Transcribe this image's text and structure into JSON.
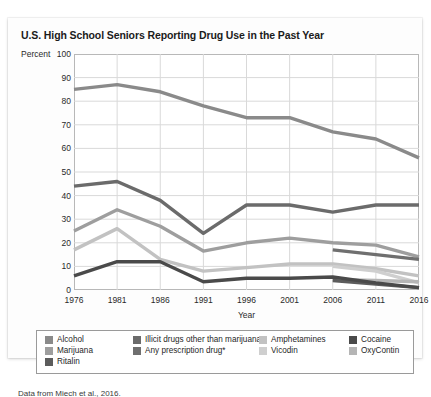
{
  "figure": {
    "title": "U.S. High School Seniors Reporting Drug Use in the Past Year",
    "percent_axis_label": "Percent",
    "source_note": "Data from Miech et al., 2016."
  },
  "chart_data": {
    "type": "line",
    "title": "U.S. High School Seniors Reporting Drug Use in the Past Year",
    "xlabel": "Year",
    "ylabel": "Percent",
    "x": [
      1976,
      1981,
      1986,
      1991,
      1996,
      2001,
      2006,
      2011,
      2016
    ],
    "xlim": [
      1976,
      2016
    ],
    "ylim": [
      0,
      100
    ],
    "xticks": [
      "1976",
      "1981",
      "1986",
      "1991",
      "1996",
      "2001",
      "2006",
      "2011",
      "2016"
    ],
    "yticks": [
      "0",
      "10",
      "20",
      "30",
      "40",
      "50",
      "60",
      "70",
      "80",
      "90",
      "100"
    ],
    "grid": true,
    "legend_position": "below",
    "series": [
      {
        "name": "Alcohol",
        "color": "#8a8a8a",
        "x": [
          1976,
          1981,
          1986,
          1991,
          1996,
          2001,
          2006,
          2011,
          2016
        ],
        "values": [
          85,
          87,
          84,
          78,
          73,
          73,
          67,
          64,
          56
        ]
      },
      {
        "name": "Illicit drugs other than marijuana",
        "color": "#6b6b6b",
        "x": [
          1976,
          1981,
          1986,
          1991,
          1996,
          2001,
          2006,
          2011,
          2016
        ],
        "values": [
          44,
          46,
          38,
          24,
          36,
          36,
          33,
          36,
          36
        ]
      },
      {
        "name": "Marijuana",
        "color": "#9e9e9e",
        "x": [
          1976,
          1981,
          1986,
          1991,
          1996,
          2001,
          2006,
          2011,
          2016
        ],
        "values": [
          25,
          34,
          27,
          16.5,
          20,
          22,
          20,
          19,
          14
        ]
      },
      {
        "name": "Any prescription drug*",
        "color": "#6f6f6f",
        "x": [
          2006,
          2011,
          2016
        ],
        "values": [
          17,
          15,
          13
        ]
      },
      {
        "name": "Amphetamines",
        "color": "#c2c2c2",
        "x": [
          1976,
          1981,
          1986,
          1991,
          1996,
          2001,
          2006,
          2011,
          2016
        ],
        "values": [
          17,
          26,
          13,
          8,
          9.5,
          11,
          11,
          9,
          6
        ]
      },
      {
        "name": "Vicodin",
        "color": "#cfcfcf",
        "x": [
          2006,
          2011,
          2016
        ],
        "values": [
          10,
          8,
          3
        ]
      },
      {
        "name": "Cocaine",
        "color": "#4a4a4a",
        "x": [
          1976,
          1981,
          1986,
          1991,
          1996,
          2001,
          2006,
          2011,
          2016
        ],
        "values": [
          6,
          12,
          12,
          3.5,
          5,
          5,
          5.5,
          3,
          1
        ]
      },
      {
        "name": "OxyContin",
        "color": "#b5b5b5",
        "x": [
          2006,
          2011,
          2016
        ],
        "values": [
          4.5,
          4,
          3.5
        ]
      },
      {
        "name": "Ritalin",
        "color": "#5c5c5c",
        "x": [
          2006,
          2011,
          2016
        ],
        "values": [
          4,
          2.5,
          1
        ]
      }
    ]
  },
  "legend": {
    "items": [
      {
        "label": "Alcohol",
        "color": "#8a8a8a",
        "col": 0,
        "row": 0
      },
      {
        "label": "Marijuana",
        "color": "#9e9e9e",
        "col": 0,
        "row": 1
      },
      {
        "label": "Ritalin",
        "color": "#5c5c5c",
        "col": 0,
        "row": 2
      },
      {
        "label": "Illicit drugs other than marijuana",
        "color": "#6b6b6b",
        "col": 1,
        "row": 0
      },
      {
        "label": "Any prescription drug*",
        "color": "#6f6f6f",
        "col": 1,
        "row": 1
      },
      {
        "label": "Amphetamines",
        "color": "#c2c2c2",
        "col": 2,
        "row": 0
      },
      {
        "label": "Vicodin",
        "color": "#cfcfcf",
        "col": 2,
        "row": 1
      },
      {
        "label": "Cocaine",
        "color": "#4a4a4a",
        "col": 3,
        "row": 0
      },
      {
        "label": "OxyContin",
        "color": "#b5b5b5",
        "col": 3,
        "row": 1
      }
    ]
  },
  "colors": {
    "grid": "#d9d9d9",
    "axis": "#b8b8b8",
    "card_bg": "#fdfdfd",
    "plot_bg": "#ffffff",
    "text": "#1f1f1f"
  }
}
